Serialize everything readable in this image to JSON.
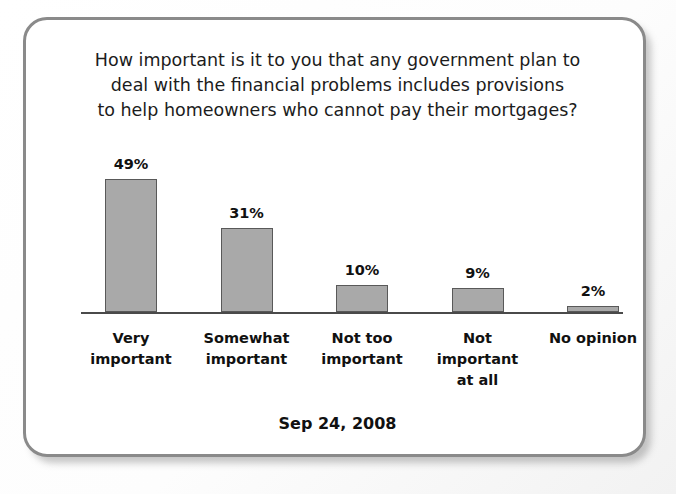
{
  "card": {
    "title_lines": [
      "How important is it to you that any government plan to",
      "deal with the financial problems includes provisions",
      "to help homeowners who cannot pay their mortgages?"
    ],
    "date_caption": "Sep 24, 2008"
  },
  "chart_data": {
    "type": "bar",
    "title": "How important is it to you that any government plan to deal with the financial problems includes provisions to help homeowners who cannot pay their mortgages?",
    "subtitle": "Sep 24, 2008",
    "categories": [
      "Very important",
      "Somewhat important",
      "Not too important",
      "Not important at all",
      "No opinion"
    ],
    "category_lines": [
      [
        "Very",
        "important"
      ],
      [
        "Somewhat",
        "important"
      ],
      [
        "Not too",
        "important"
      ],
      [
        "Not",
        "important",
        "at all"
      ],
      [
        "No opinion"
      ]
    ],
    "values": [
      49,
      31,
      10,
      9,
      2
    ],
    "value_labels": [
      "49%",
      "31%",
      "10%",
      "9%",
      "2%"
    ],
    "xlabel": "",
    "ylabel": "",
    "ylim": [
      0,
      49
    ],
    "grid": false,
    "legend": "none",
    "bar_fill": "#a9a9a9",
    "bar_stroke": "#595959",
    "axis_color": "#4a4a4a"
  }
}
